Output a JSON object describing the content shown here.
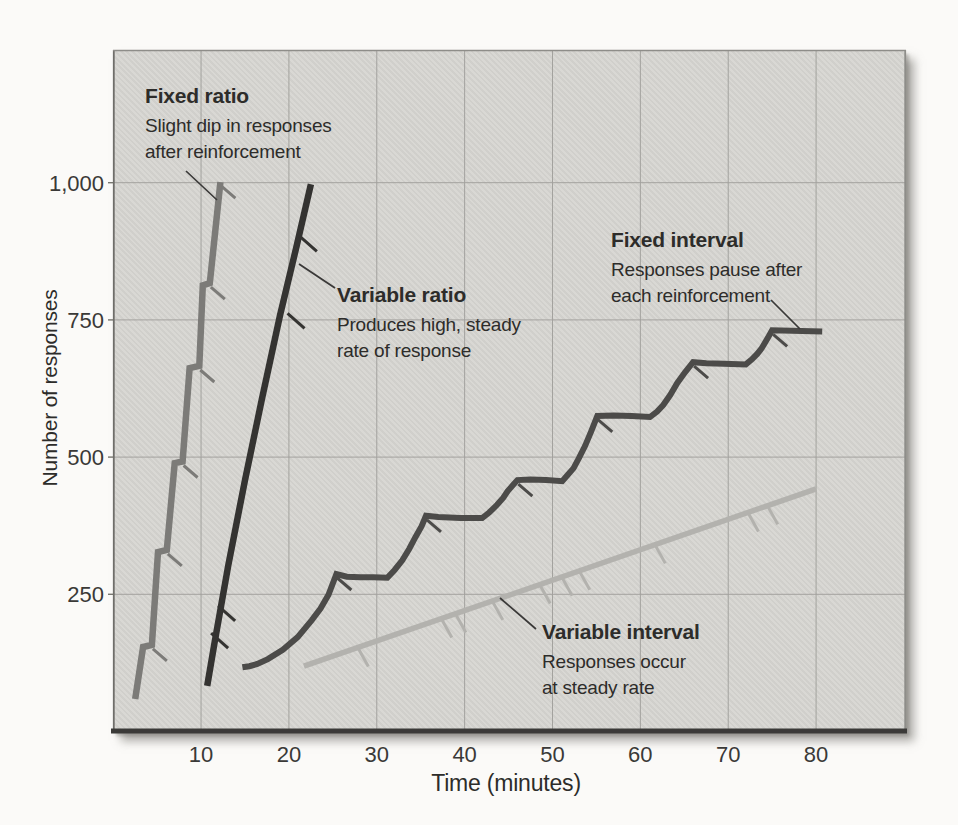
{
  "figure": {
    "y_axis": {
      "title": "Number of responses",
      "tick_labels": [
        "1,000",
        "750",
        "500",
        "250"
      ]
    },
    "x_axis": {
      "title": "Time (minutes)",
      "tick_labels": [
        "10",
        "20",
        "30",
        "40",
        "50",
        "60",
        "70",
        "80"
      ]
    },
    "annotations": {
      "fixed_ratio": {
        "title": "Fixed ratio",
        "line1": "Slight dip in responses",
        "line2": "after reinforcement"
      },
      "variable_ratio": {
        "title": "Variable ratio",
        "line1": "Produces high, steady",
        "line2": "rate of response"
      },
      "fixed_interval": {
        "title": "Fixed interval",
        "line1": "Responses pause after",
        "line2": "each reinforcement"
      },
      "variable_interval": {
        "title": "Variable interval",
        "line1": "Responses occur",
        "line2": "at steady rate"
      }
    }
  },
  "chart_data": {
    "type": "line",
    "xlabel": "Time (minutes)",
    "ylabel": "Number of responses",
    "xlim": [
      0,
      90
    ],
    "ylim": [
      0,
      1240
    ],
    "x_ticks": [
      10,
      20,
      30,
      40,
      50,
      60,
      70,
      80
    ],
    "y_ticks": [
      250,
      500,
      750,
      1000
    ],
    "grid": true,
    "legend_position": "inline-annotations",
    "colors": {
      "panel_bg": "#d7d6d2",
      "grid": "#a3a29e",
      "border_light": "#8e8d89",
      "border_left": "#6f6e6a",
      "border_bottom": "#3b3a38",
      "pointer": "#3a3938",
      "text": "#2d2c2a"
    },
    "series": [
      {
        "name": "Fixed ratio",
        "color": "#7c7b78",
        "width": 6.5,
        "points": [
          [
            2.5,
            59
          ],
          [
            3.4,
            154
          ],
          [
            4.4,
            158
          ],
          [
            5.1,
            327
          ],
          [
            6.1,
            331
          ],
          [
            7.0,
            489
          ],
          [
            7.9,
            492
          ],
          [
            8.7,
            662
          ],
          [
            9.8,
            666
          ],
          [
            10.2,
            813
          ],
          [
            11.0,
            817
          ],
          [
            12.2,
            1001
          ]
        ],
        "reinforcement_ticks": [
          [
            4.4,
            158
          ],
          [
            6.1,
            331
          ],
          [
            7.9,
            492
          ],
          [
            9.8,
            666
          ],
          [
            11.0,
            817
          ],
          [
            12.2,
            1001
          ]
        ]
      },
      {
        "name": "Variable ratio",
        "color": "#343331",
        "width": 6.5,
        "points": [
          [
            10.7,
            83
          ],
          [
            11.5,
            158
          ],
          [
            13.1,
            303
          ],
          [
            15.0,
            458
          ],
          [
            16.9,
            604
          ],
          [
            19.0,
            759
          ],
          [
            20.9,
            886
          ],
          [
            22.5,
            997
          ]
        ],
        "reinforcement_ticks": [
          [
            11.6,
            170
          ],
          [
            12.4,
            220
          ],
          [
            20.3,
            753
          ],
          [
            21.7,
            893
          ]
        ]
      },
      {
        "name": "Fixed interval",
        "color": "#4c4b49",
        "width": 6,
        "points": [
          [
            14.7,
            117
          ],
          [
            15.5,
            119
          ],
          [
            16.4,
            123
          ],
          [
            17.6,
            132
          ],
          [
            19.3,
            149
          ],
          [
            21.0,
            172
          ],
          [
            22.6,
            203
          ],
          [
            23.6,
            224
          ],
          [
            24.5,
            249
          ],
          [
            25.4,
            287
          ],
          [
            26.6,
            282
          ],
          [
            28.1,
            281
          ],
          [
            29.6,
            281
          ],
          [
            31.2,
            280
          ],
          [
            32.0,
            294
          ],
          [
            32.9,
            312
          ],
          [
            33.7,
            333
          ],
          [
            34.4,
            354
          ],
          [
            35.1,
            374
          ],
          [
            35.6,
            393
          ],
          [
            37.0,
            391
          ],
          [
            39.5,
            389
          ],
          [
            42.0,
            389
          ],
          [
            42.8,
            399
          ],
          [
            43.7,
            413
          ],
          [
            44.4,
            426
          ],
          [
            44.9,
            438
          ],
          [
            45.5,
            449
          ],
          [
            46.0,
            458
          ],
          [
            47.5,
            459
          ],
          [
            49.3,
            458
          ],
          [
            51.1,
            456
          ],
          [
            51.7,
            467
          ],
          [
            52.4,
            480
          ],
          [
            53.0,
            498
          ],
          [
            53.7,
            520
          ],
          [
            54.4,
            547
          ],
          [
            55.1,
            575
          ],
          [
            57.0,
            576
          ],
          [
            59.0,
            575
          ],
          [
            61.1,
            573
          ],
          [
            61.9,
            583
          ],
          [
            62.6,
            595
          ],
          [
            63.4,
            613
          ],
          [
            64.2,
            635
          ],
          [
            65.1,
            655
          ],
          [
            66.0,
            673
          ],
          [
            67.5,
            671
          ],
          [
            69.5,
            670
          ],
          [
            72.0,
            669
          ],
          [
            72.7,
            678
          ],
          [
            73.3,
            688
          ],
          [
            73.8,
            698
          ],
          [
            74.2,
            709
          ],
          [
            74.6,
            720
          ],
          [
            75.0,
            731
          ],
          [
            80.7,
            729
          ]
        ],
        "reinforcement_ticks": [
          [
            25.4,
            287
          ],
          [
            35.6,
            393
          ],
          [
            46.0,
            458
          ],
          [
            55.1,
            575
          ],
          [
            66.0,
            673
          ],
          [
            75.0,
            731
          ]
        ]
      },
      {
        "name": "Variable interval",
        "color": "#b3b2ae",
        "width": 5.5,
        "points": [
          [
            21.7,
            119
          ],
          [
            80.0,
            442
          ]
        ],
        "reinforcement_ticks": [
          [
            27.9,
            153
          ],
          [
            37.4,
            206
          ],
          [
            39.0,
            215
          ],
          [
            43.2,
            238
          ],
          [
            48.6,
            268
          ],
          [
            51.1,
            282
          ],
          [
            53.1,
            293
          ],
          [
            61.7,
            341
          ],
          [
            72.3,
            399
          ],
          [
            74.5,
            412
          ]
        ]
      }
    ]
  }
}
